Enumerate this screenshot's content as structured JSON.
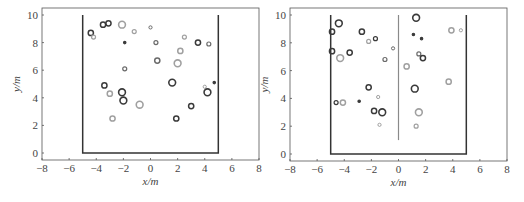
{
  "chart_data": [
    {
      "type": "scatter",
      "title": "",
      "xlabel": "x/m",
      "ylabel": "y/m",
      "xlim": [
        -8,
        8
      ],
      "ylim": [
        -0.4,
        10.4
      ],
      "xticks": [
        "−8",
        "−6",
        "−4",
        "−2",
        "0",
        "2",
        "4",
        "6",
        "8"
      ],
      "yticks": [
        "0",
        "2",
        "4",
        "6",
        "8",
        "10"
      ],
      "grid": false,
      "walls": [
        {
          "x": [
            -5,
            -5,
            5,
            5
          ],
          "y": [
            10,
            0,
            0,
            10
          ]
        }
      ],
      "points": [
        {
          "x": -4.4,
          "y": 8.7,
          "size": "medium",
          "shade": "dark"
        },
        {
          "x": -4.2,
          "y": 8.4,
          "size": "small",
          "shade": "light"
        },
        {
          "x": -3.5,
          "y": 9.3,
          "size": "medium",
          "shade": "dark"
        },
        {
          "x": -3.1,
          "y": 9.4,
          "size": "medium",
          "shade": "dark"
        },
        {
          "x": -2.1,
          "y": 9.3,
          "size": "large",
          "shade": "light"
        },
        {
          "x": -1.2,
          "y": 8.8,
          "size": "small",
          "shade": "light"
        },
        {
          "x": 0.0,
          "y": 9.1,
          "size": "tiny",
          "shade": "mid"
        },
        {
          "x": -1.9,
          "y": 8.0,
          "size": "dot",
          "shade": "dark"
        },
        {
          "x": 0.4,
          "y": 8.0,
          "size": "small",
          "shade": "mid"
        },
        {
          "x": 2.5,
          "y": 8.4,
          "size": "small",
          "shade": "light"
        },
        {
          "x": 3.5,
          "y": 8.0,
          "size": "medium",
          "shade": "dark"
        },
        {
          "x": 4.3,
          "y": 7.9,
          "size": "small",
          "shade": "mid"
        },
        {
          "x": 2.2,
          "y": 7.4,
          "size": "medium",
          "shade": "light"
        },
        {
          "x": 0.5,
          "y": 6.7,
          "size": "medium",
          "shade": "mid"
        },
        {
          "x": 2.0,
          "y": 6.5,
          "size": "large",
          "shade": "light"
        },
        {
          "x": -1.9,
          "y": 6.1,
          "size": "small",
          "shade": "mid"
        },
        {
          "x": 1.6,
          "y": 5.1,
          "size": "large",
          "shade": "dark"
        },
        {
          "x": 4.7,
          "y": 5.1,
          "size": "dot",
          "shade": "dark"
        },
        {
          "x": -3.4,
          "y": 4.9,
          "size": "medium",
          "shade": "dark"
        },
        {
          "x": 4.0,
          "y": 4.8,
          "size": "tiny",
          "shade": "light"
        },
        {
          "x": -3.0,
          "y": 4.3,
          "size": "medium",
          "shade": "light"
        },
        {
          "x": -2.1,
          "y": 4.4,
          "size": "large",
          "shade": "dark"
        },
        {
          "x": 4.2,
          "y": 4.4,
          "size": "large",
          "shade": "dark"
        },
        {
          "x": -2.0,
          "y": 3.8,
          "size": "large",
          "shade": "dark"
        },
        {
          "x": -0.8,
          "y": 3.5,
          "size": "large",
          "shade": "light"
        },
        {
          "x": 3.0,
          "y": 3.4,
          "size": "medium",
          "shade": "dark"
        },
        {
          "x": -2.8,
          "y": 2.5,
          "size": "medium",
          "shade": "light"
        },
        {
          "x": 1.9,
          "y": 2.5,
          "size": "medium",
          "shade": "dark"
        }
      ]
    },
    {
      "type": "scatter",
      "title": "",
      "xlabel": "x/m",
      "ylabel": "y/m",
      "xlim": [
        -8,
        8
      ],
      "ylim": [
        -0.4,
        10.4
      ],
      "xticks": [
        "−8",
        "−6",
        "−4",
        "−2",
        "0",
        "2",
        "4",
        "6",
        "8"
      ],
      "yticks": [
        "0",
        "2",
        "4",
        "6",
        "8",
        "10"
      ],
      "grid": false,
      "walls": [
        {
          "x": [
            -5,
            -5,
            5,
            5
          ],
          "y": [
            10,
            0,
            0,
            10
          ]
        },
        {
          "x": [
            0,
            0
          ],
          "y": [
            10,
            1
          ]
        }
      ],
      "points": [
        {
          "x": -4.4,
          "y": 9.4,
          "size": "large",
          "shade": "dark"
        },
        {
          "x": -4.9,
          "y": 8.8,
          "size": "medium",
          "shade": "dark"
        },
        {
          "x": -2.7,
          "y": 8.8,
          "size": "medium",
          "shade": "dark"
        },
        {
          "x": -1.7,
          "y": 8.3,
          "size": "small",
          "shade": "dark"
        },
        {
          "x": -2.2,
          "y": 8.1,
          "size": "small",
          "shade": "light"
        },
        {
          "x": -0.4,
          "y": 7.6,
          "size": "tiny",
          "shade": "mid"
        },
        {
          "x": -4.9,
          "y": 7.4,
          "size": "medium",
          "shade": "dark"
        },
        {
          "x": -3.6,
          "y": 7.3,
          "size": "medium",
          "shade": "dark"
        },
        {
          "x": -4.3,
          "y": 6.9,
          "size": "large",
          "shade": "light"
        },
        {
          "x": -1.0,
          "y": 6.8,
          "size": "small",
          "shade": "mid"
        },
        {
          "x": 1.3,
          "y": 9.8,
          "size": "large",
          "shade": "dark"
        },
        {
          "x": 1.1,
          "y": 8.6,
          "size": "dot",
          "shade": "dark"
        },
        {
          "x": 1.7,
          "y": 8.3,
          "size": "dot",
          "shade": "dark"
        },
        {
          "x": 3.9,
          "y": 8.9,
          "size": "medium",
          "shade": "light"
        },
        {
          "x": 4.6,
          "y": 8.9,
          "size": "tiny",
          "shade": "light"
        },
        {
          "x": 1.5,
          "y": 7.2,
          "size": "small",
          "shade": "mid"
        },
        {
          "x": 1.8,
          "y": 6.9,
          "size": "medium",
          "shade": "dark"
        },
        {
          "x": 0.6,
          "y": 6.3,
          "size": "medium",
          "shade": "light"
        },
        {
          "x": 3.7,
          "y": 5.2,
          "size": "medium",
          "shade": "light"
        },
        {
          "x": -2.2,
          "y": 4.8,
          "size": "medium",
          "shade": "dark"
        },
        {
          "x": 1.2,
          "y": 4.7,
          "size": "large",
          "shade": "dark"
        },
        {
          "x": -1.5,
          "y": 4.1,
          "size": "tiny",
          "shade": "light"
        },
        {
          "x": -4.6,
          "y": 3.7,
          "size": "small",
          "shade": "dark"
        },
        {
          "x": -4.1,
          "y": 3.7,
          "size": "medium",
          "shade": "light"
        },
        {
          "x": -2.9,
          "y": 3.8,
          "size": "dot",
          "shade": "dark"
        },
        {
          "x": -1.8,
          "y": 3.1,
          "size": "medium",
          "shade": "dark"
        },
        {
          "x": -1.2,
          "y": 3.0,
          "size": "large",
          "shade": "dark"
        },
        {
          "x": 1.5,
          "y": 3.0,
          "size": "large",
          "shade": "light"
        },
        {
          "x": -1.4,
          "y": 2.1,
          "size": "tiny",
          "shade": "light"
        },
        {
          "x": 1.3,
          "y": 2.0,
          "size": "small",
          "shade": "light"
        }
      ]
    }
  ],
  "panels": [
    {
      "xlabel": "x/m",
      "ylabel": "y/m"
    },
    {
      "xlabel": "x/m",
      "ylabel": "y/m"
    }
  ],
  "colors": {
    "dark": "#3a3a3a",
    "mid": "#6a6a6a",
    "light": "#a0a0a0",
    "frame": "#555555",
    "wall": "#333333",
    "inner_wall": "#8a8a8a"
  }
}
